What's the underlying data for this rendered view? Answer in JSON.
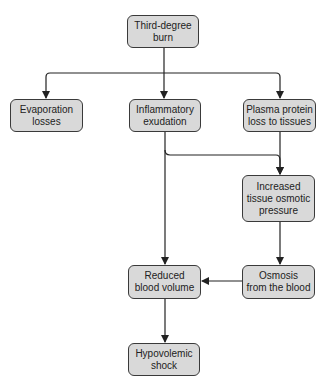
{
  "diagram": {
    "type": "flowchart",
    "nodes": {
      "burn": {
        "label": "Third-degree\nburn"
      },
      "evaporation": {
        "label": "Evaporation\nlosses"
      },
      "inflammatory": {
        "label": "Inflammatory\nexudation"
      },
      "plasma": {
        "label": "Plasma protein\nloss to tissues"
      },
      "osmotic": {
        "label": "Increased\ntissue osmotic\npressure"
      },
      "osmosis": {
        "label": "Osmosis\nfrom the blood"
      },
      "reduced": {
        "label": "Reduced\nblood volume"
      },
      "shock": {
        "label": "Hypovolemic\nshock"
      }
    },
    "edges": [
      {
        "from": "burn",
        "to": "evaporation"
      },
      {
        "from": "burn",
        "to": "inflammatory"
      },
      {
        "from": "burn",
        "to": "plasma"
      },
      {
        "from": "inflammatory",
        "to": "osmotic"
      },
      {
        "from": "plasma",
        "to": "osmotic"
      },
      {
        "from": "osmotic",
        "to": "osmosis"
      },
      {
        "from": "inflammatory",
        "to": "reduced"
      },
      {
        "from": "osmosis",
        "to": "reduced"
      },
      {
        "from": "reduced",
        "to": "shock"
      }
    ],
    "colors": {
      "node_fill": "#d9d9d9",
      "node_border": "#3a3a3a",
      "line": "#222222"
    }
  }
}
